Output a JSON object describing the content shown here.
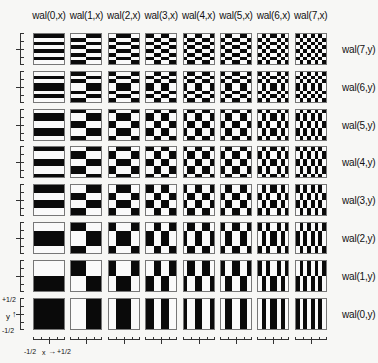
{
  "figure": {
    "column_labels": [
      "wal(0,x)",
      "wal(1,x)",
      "wal(2,x)",
      "wal(3,x)",
      "wal(4,x)",
      "wal(5,x)",
      "wal(6,x)",
      "wal(7,x)"
    ],
    "row_labels": [
      "wal(7,y)",
      "wal(6,y)",
      "wal(5,y)",
      "wal(4,y)",
      "wal(3,y)",
      "wal(2,y)",
      "wal(1,y)",
      "wal(0,y)"
    ],
    "walsh_patterns_8bit": {
      "0": [
        1,
        1,
        1,
        1,
        1,
        1,
        1,
        1
      ],
      "1": [
        0,
        0,
        0,
        0,
        1,
        1,
        1,
        1
      ],
      "2": [
        0,
        0,
        1,
        1,
        1,
        1,
        0,
        0
      ],
      "3": [
        1,
        1,
        0,
        0,
        1,
        1,
        0,
        0
      ],
      "4": [
        1,
        0,
        0,
        1,
        1,
        0,
        0,
        1
      ],
      "5": [
        0,
        1,
        1,
        0,
        0,
        1,
        1,
        0
      ],
      "6": [
        0,
        1,
        0,
        1,
        1,
        0,
        1,
        0
      ],
      "7": [
        1,
        0,
        1,
        0,
        1,
        0,
        1,
        0
      ]
    },
    "row_order_y_index": [
      7,
      6,
      5,
      4,
      3,
      2,
      1,
      0
    ],
    "axis": {
      "y_top": "+1/2",
      "y_bottom": "-1/2",
      "y_name": "y",
      "x_left": "-1/2",
      "x_right": "+1/2",
      "x_name": "x"
    },
    "colors": {
      "black": "#0a0a0a",
      "white": "#fafafa",
      "border": "#777777"
    }
  }
}
